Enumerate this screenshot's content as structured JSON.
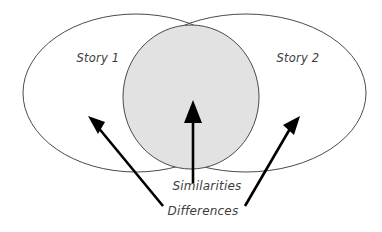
{
  "figure": {
    "type": "venn-diagram",
    "title": "",
    "background_color": "#ffffff",
    "outline_color": "#4a4a4a",
    "shade_color": "#e2e2e2",
    "arrow_color": "#000000",
    "text_color": "#3d3d3d"
  },
  "sets": {
    "left": {
      "label": "Story 1",
      "label_x": 98,
      "label_y": 62
    },
    "right": {
      "label": "Story 2",
      "label_x": 298,
      "label_y": 62
    }
  },
  "annotations": {
    "similarities": {
      "label": "Similarities",
      "label_x": 207,
      "label_y": 190
    },
    "differences": {
      "label": "Differences",
      "label_x": 203,
      "label_y": 215
    }
  },
  "arrows": [
    {
      "name": "differences-left-arrow",
      "from_x": 163,
      "from_y": 206,
      "to_x": 90,
      "to_y": 117
    },
    {
      "name": "similarities-center-arrow",
      "from_x": 193,
      "from_y": 183,
      "to_x": 193,
      "to_y": 101
    },
    {
      "name": "differences-right-arrow",
      "from_x": 245,
      "from_y": 206,
      "to_x": 299,
      "to_y": 117
    }
  ]
}
